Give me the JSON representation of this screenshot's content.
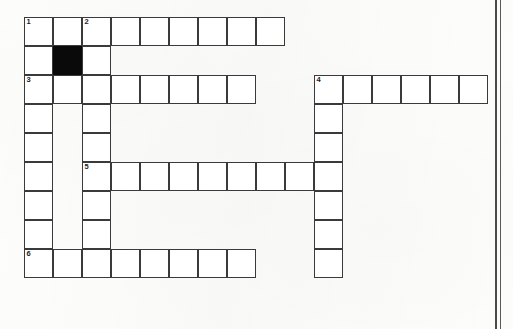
{
  "document": {
    "type": "crossword-puzzle-worksheet",
    "background_color": "#fdfdfc",
    "ink_color": "#3a3a3a",
    "blocked_cell_color": "#0a0a0a"
  },
  "grid": {
    "cell_size": 29,
    "origin_x": 24,
    "origin_y": 17,
    "columns": 16,
    "rows": 9,
    "clue_numbers": [
      "1",
      "2",
      "3",
      "4",
      "5",
      "6"
    ],
    "cells": [
      {
        "row": 1,
        "col": 1,
        "number": "1",
        "blocked": false
      },
      {
        "row": 1,
        "col": 2,
        "number": "",
        "blocked": false
      },
      {
        "row": 1,
        "col": 3,
        "number": "2",
        "blocked": false
      },
      {
        "row": 1,
        "col": 4,
        "number": "",
        "blocked": false
      },
      {
        "row": 1,
        "col": 5,
        "number": "",
        "blocked": false
      },
      {
        "row": 1,
        "col": 6,
        "number": "",
        "blocked": false
      },
      {
        "row": 1,
        "col": 7,
        "number": "",
        "blocked": false
      },
      {
        "row": 1,
        "col": 8,
        "number": "",
        "blocked": false
      },
      {
        "row": 1,
        "col": 9,
        "number": "",
        "blocked": false
      },
      {
        "row": 2,
        "col": 1,
        "number": "",
        "blocked": false
      },
      {
        "row": 2,
        "col": 2,
        "number": "",
        "blocked": true
      },
      {
        "row": 2,
        "col": 3,
        "number": "",
        "blocked": false
      },
      {
        "row": 3,
        "col": 1,
        "number": "3",
        "blocked": false
      },
      {
        "row": 3,
        "col": 2,
        "number": "",
        "blocked": false
      },
      {
        "row": 3,
        "col": 3,
        "number": "",
        "blocked": false
      },
      {
        "row": 3,
        "col": 4,
        "number": "",
        "blocked": false
      },
      {
        "row": 3,
        "col": 5,
        "number": "",
        "blocked": false
      },
      {
        "row": 3,
        "col": 6,
        "number": "",
        "blocked": false
      },
      {
        "row": 3,
        "col": 7,
        "number": "",
        "blocked": false
      },
      {
        "row": 3,
        "col": 8,
        "number": "",
        "blocked": false
      },
      {
        "row": 3,
        "col": 11,
        "number": "4",
        "blocked": false
      },
      {
        "row": 3,
        "col": 12,
        "number": "",
        "blocked": false
      },
      {
        "row": 3,
        "col": 13,
        "number": "",
        "blocked": false
      },
      {
        "row": 3,
        "col": 14,
        "number": "",
        "blocked": false
      },
      {
        "row": 3,
        "col": 15,
        "number": "",
        "blocked": false
      },
      {
        "row": 3,
        "col": 16,
        "number": "",
        "blocked": false
      },
      {
        "row": 4,
        "col": 1,
        "number": "",
        "blocked": false
      },
      {
        "row": 4,
        "col": 3,
        "number": "",
        "blocked": false
      },
      {
        "row": 4,
        "col": 11,
        "number": "",
        "blocked": false
      },
      {
        "row": 5,
        "col": 1,
        "number": "",
        "blocked": false
      },
      {
        "row": 5,
        "col": 3,
        "number": "",
        "blocked": false
      },
      {
        "row": 5,
        "col": 11,
        "number": "",
        "blocked": false
      },
      {
        "row": 6,
        "col": 1,
        "number": "",
        "blocked": false
      },
      {
        "row": 6,
        "col": 3,
        "number": "5",
        "blocked": false
      },
      {
        "row": 6,
        "col": 4,
        "number": "",
        "blocked": false
      },
      {
        "row": 6,
        "col": 5,
        "number": "",
        "blocked": false
      },
      {
        "row": 6,
        "col": 6,
        "number": "",
        "blocked": false
      },
      {
        "row": 6,
        "col": 7,
        "number": "",
        "blocked": false
      },
      {
        "row": 6,
        "col": 8,
        "number": "",
        "blocked": false
      },
      {
        "row": 6,
        "col": 9,
        "number": "",
        "blocked": false
      },
      {
        "row": 6,
        "col": 10,
        "number": "",
        "blocked": false
      },
      {
        "row": 6,
        "col": 11,
        "number": "",
        "blocked": false
      },
      {
        "row": 7,
        "col": 1,
        "number": "",
        "blocked": false
      },
      {
        "row": 7,
        "col": 3,
        "number": "",
        "blocked": false
      },
      {
        "row": 7,
        "col": 11,
        "number": "",
        "blocked": false
      },
      {
        "row": 8,
        "col": 1,
        "number": "",
        "blocked": false
      },
      {
        "row": 8,
        "col": 3,
        "number": "",
        "blocked": false
      },
      {
        "row": 8,
        "col": 11,
        "number": "",
        "blocked": false
      },
      {
        "row": 9,
        "col": 1,
        "number": "6",
        "blocked": false
      },
      {
        "row": 9,
        "col": 2,
        "number": "",
        "blocked": false
      },
      {
        "row": 9,
        "col": 3,
        "number": "",
        "blocked": false
      },
      {
        "row": 9,
        "col": 4,
        "number": "",
        "blocked": false
      },
      {
        "row": 9,
        "col": 5,
        "number": "",
        "blocked": false
      },
      {
        "row": 9,
        "col": 6,
        "number": "",
        "blocked": false
      },
      {
        "row": 9,
        "col": 7,
        "number": "",
        "blocked": false
      },
      {
        "row": 9,
        "col": 8,
        "number": "",
        "blocked": false
      },
      {
        "row": 9,
        "col": 11,
        "number": "",
        "blocked": false
      }
    ]
  },
  "page_edge": {
    "lines": [
      {
        "x": 495,
        "width": 1.6,
        "color": "#4a4a4a"
      },
      {
        "x": 500,
        "width": 1.2,
        "color": "#5a5a5a"
      }
    ]
  }
}
